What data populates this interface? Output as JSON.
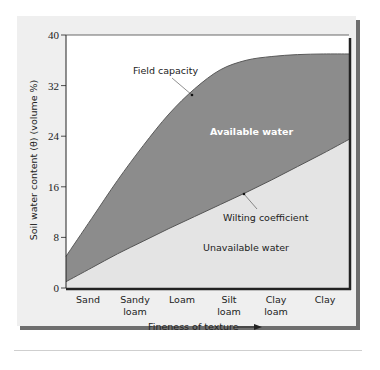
{
  "chart_data": {
    "type": "area",
    "title": "",
    "xlabel": "Fineness of texture",
    "ylabel": "Soil water content (θ) (volume %)",
    "ylim": [
      0,
      40
    ],
    "yticks": [
      0,
      8,
      16,
      24,
      32,
      40
    ],
    "categories": [
      "Sand",
      "Sandy loam",
      "Loam",
      "Silt loam",
      "Clay loam",
      "Clay"
    ],
    "category_lines": [
      [
        "Sand"
      ],
      [
        "Sandy",
        "loam"
      ],
      [
        "Loam"
      ],
      [
        "Silt",
        "loam"
      ],
      [
        "Clay",
        "loam"
      ],
      [
        "Clay"
      ]
    ],
    "grid": false,
    "series": [
      {
        "name": "Field capacity",
        "x": [
          0,
          0.5,
          1,
          1.5,
          2,
          2.5,
          3,
          3.5,
          4,
          4.5,
          5,
          5.5
        ],
        "values": [
          5,
          11,
          17,
          22.5,
          27.5,
          31.5,
          34.5,
          36,
          36.6,
          36.9,
          37,
          37
        ]
      },
      {
        "name": "Wilting coefficient",
        "x": [
          0,
          0.5,
          1,
          1.5,
          2,
          2.5,
          3,
          3.5,
          4,
          4.5,
          5,
          5.5
        ],
        "values": [
          1,
          3.2,
          5.4,
          7.4,
          9.4,
          11.3,
          13.2,
          15.1,
          17.1,
          19.2,
          21.3,
          23.5
        ]
      }
    ],
    "regions": [
      {
        "name": "Available water",
        "between": [
          "Wilting coefficient",
          "Field capacity"
        ],
        "color": "#8c8c8c"
      },
      {
        "name": "Unavailable water",
        "between": [
          "axis",
          "Wilting coefficient"
        ],
        "color": "#e4e4e4"
      }
    ],
    "annotations": [
      "Field capacity",
      "Available water",
      "Wilting coefficient",
      "Unavailable water"
    ]
  },
  "labels": {
    "ylabel": "Soil water content (θ) (volume %)",
    "xlabel": "Fineness of texture",
    "field_capacity": "Field capacity",
    "available_water": "Available water",
    "wilting_coefficient": "Wilting coefficient",
    "unavailable_water": "Unavailable water",
    "yticks": [
      "0",
      "8",
      "16",
      "24",
      "32",
      "40"
    ],
    "cat_sand": "Sand",
    "cat_sandy": "Sandy",
    "cat_sandy_loam": "loam",
    "cat_loam": "Loam",
    "cat_silt": "Silt",
    "cat_silt_loam": "loam",
    "cat_clay_l1": "Clay",
    "cat_clay_loam": "loam",
    "cat_clay": "Clay"
  },
  "colors": {
    "card_bg": "#efefef",
    "shadow": "#6e6e6e",
    "available": "#8c8c8c",
    "unavailable": "#e4e4e4",
    "axis": "#222222"
  }
}
